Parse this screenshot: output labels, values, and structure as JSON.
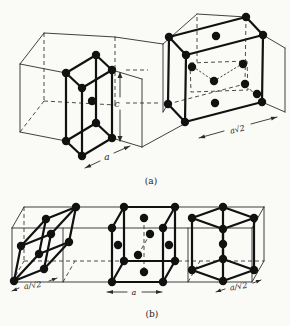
{
  "colors": {
    "background": "#fafaf7",
    "ink": "#111111"
  },
  "panel_a": {
    "caption": "(a)",
    "label_c": "c",
    "label_a": "a",
    "label_face_diagonal": "a√2"
  },
  "panel_b": {
    "caption": "(b)",
    "label_left_cell": "a/√2",
    "label_middle_cell": "a",
    "label_right_cell": "a/√2"
  }
}
